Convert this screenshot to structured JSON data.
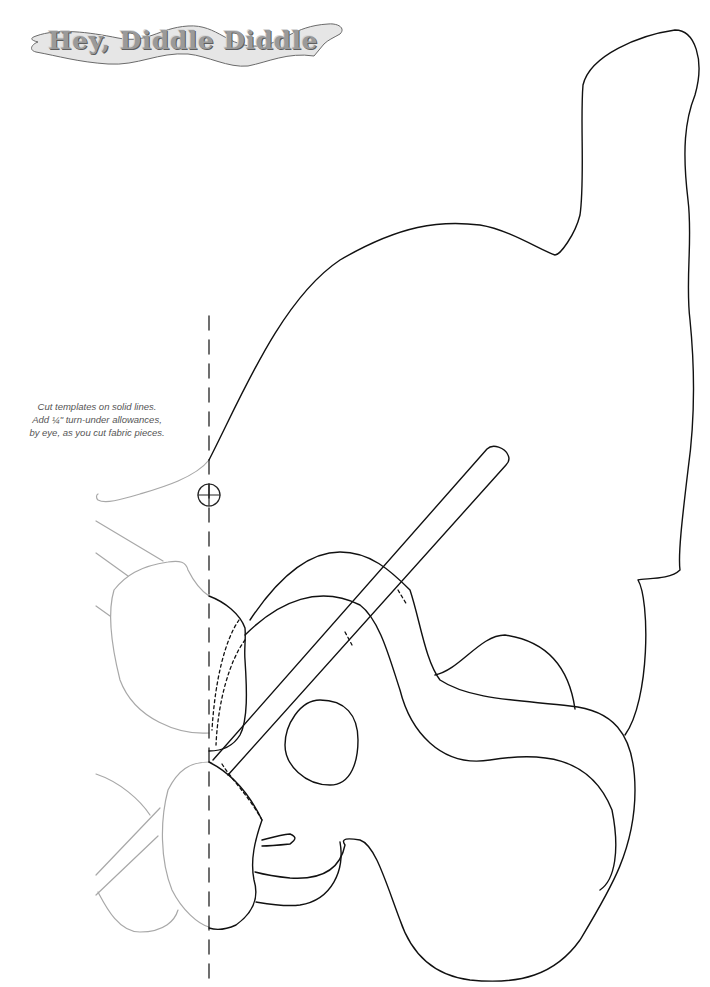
{
  "title": "Hey, Diddle Diddle",
  "instructions": {
    "line1": "Cut templates on solid lines.",
    "line2": "Add ¼\" turn-under allowances,",
    "line3": "by eye, as you cut fabric pieces."
  },
  "pattern": {
    "pieces": [
      "cat-body",
      "fiddle-body",
      "fiddle-sound-hole",
      "fiddle-bow",
      "cat-paw-upper",
      "cat-paw-lower",
      "fiddle-chinrest"
    ],
    "markings": [
      "center-fold-dashed-line",
      "registration-crosshair"
    ],
    "colors": {
      "cut_line": "#111111",
      "mirror_guide": "#a8a8a8",
      "title_text": "#9a9a9a",
      "title_banner_fill": "#e6e6e6",
      "instruction_text": "#555555"
    }
  }
}
